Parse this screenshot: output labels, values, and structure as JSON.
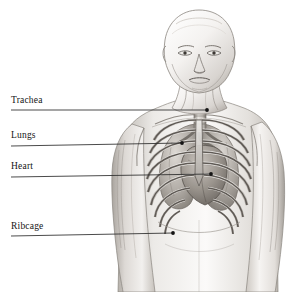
{
  "image": {
    "kind": "anatomical-illustration",
    "medium": "pencil-drawing",
    "subject": "human head and upper torso with thoracic anatomy",
    "palette": {
      "background": "#ffffff",
      "ink": "#141414",
      "leader_line": "#2a2a2a",
      "skin_light": "#f2f0ee",
      "skin_mid": "#cfcbc7",
      "skin_shadow": "#9c9791",
      "bone_light": "#e6e3df",
      "bone_mid": "#b4afa9",
      "bone_dark": "#6f6a65",
      "organ_mid": "#a8a29b",
      "organ_dark": "#6a645e"
    }
  },
  "annotations": [
    {
      "id": "trachea",
      "label": "Trachea",
      "label_x": 11,
      "label_y": 96,
      "line_x1": 11,
      "line_y1": 110,
      "line_x2": 207,
      "line_y2": 110,
      "dot_x": 207,
      "dot_y": 110
    },
    {
      "id": "lungs",
      "label": "Lungs",
      "label_x": 11,
      "label_y": 131,
      "line_x1": 11,
      "line_y1": 146,
      "line_x2": 182,
      "line_y2": 143,
      "dot_x": 182,
      "dot_y": 143
    },
    {
      "id": "heart",
      "label": "Heart",
      "label_x": 11,
      "label_y": 162,
      "line_x1": 11,
      "line_y1": 177,
      "line_x2": 211,
      "line_y2": 174,
      "dot_x": 211,
      "dot_y": 174
    },
    {
      "id": "ribcage",
      "label": "Ribcage",
      "label_x": 11,
      "label_y": 222,
      "line_x1": 11,
      "line_y1": 236,
      "line_x2": 173,
      "line_y2": 233,
      "dot_x": 173,
      "dot_y": 233
    }
  ]
}
